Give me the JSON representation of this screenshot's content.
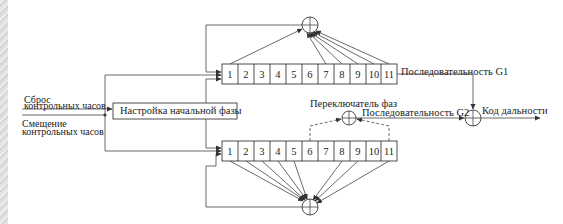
{
  "diagram": {
    "type": "block-diagram"
  },
  "inputs": {
    "reset": "Сброс\nконтрольных часов",
    "reset_line1": "Сброс",
    "reset_line2": "контрольных часов",
    "shift_line1": "Смещение",
    "shift_line2": "контрольных часов"
  },
  "blocks": {
    "phase_setup": "Настройка начальной фазы",
    "phase_selector": "Переключатель фаз"
  },
  "registers": {
    "g1": {
      "cells": [
        "1",
        "2",
        "3",
        "4",
        "5",
        "6",
        "7",
        "8",
        "9",
        "10",
        "11"
      ],
      "output_label": "Последовательность G1"
    },
    "g2": {
      "cells": [
        "1",
        "2",
        "3",
        "4",
        "5",
        "6",
        "7",
        "8",
        "9",
        "10",
        "11"
      ],
      "output_label": "Последовательность G2"
    }
  },
  "output": {
    "label": "Код дальности"
  },
  "colors": {
    "line": "#333333",
    "text": "#222222",
    "background": "#ffffff"
  }
}
